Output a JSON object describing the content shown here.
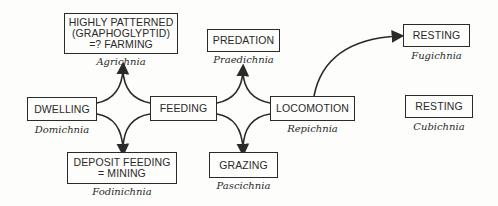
{
  "nodes": {
    "agrichnia": {
      "label": "HIGHLY PATTERNED\n(GRAPHOGLYPTID)\n=? FARMING",
      "latin": "Agrichnia"
    },
    "domichnia": {
      "label": "DWELLING",
      "latin": "Domichnia"
    },
    "feeding": {
      "label": "FEEDING"
    },
    "fodinichnia": {
      "label": "DEPOSIT FEEDING\n= MINING",
      "latin": "Fodinichnia"
    },
    "praedichnia": {
      "label": "PREDATION",
      "latin": "Praedichnia"
    },
    "repichnia": {
      "label": "LOCOMOTION",
      "latin": "Repichnia"
    },
    "pascichnia": {
      "label": "GRAZING",
      "latin": "Pascichnia"
    },
    "fugichnia": {
      "label": "RESTING",
      "latin": "Fugichnia"
    },
    "cubichnia": {
      "label": "RESTING",
      "latin": "Cubichnia"
    }
  },
  "colors": {
    "line": "#2a2a2a",
    "background": "#fdfdfb"
  }
}
